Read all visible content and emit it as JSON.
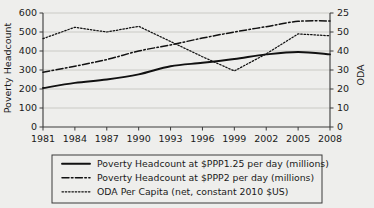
{
  "chart_data": {
    "type": "line",
    "title": "",
    "xlabel": "",
    "ylabel": "Poverty Headcount",
    "y2label": "ODA",
    "grid": true,
    "legend_position": "bottom",
    "x": [
      1981,
      1984,
      1987,
      1990,
      1993,
      1996,
      1999,
      2002,
      2005,
      2008
    ],
    "xtick_labels": [
      "1981",
      "1984",
      "1987",
      "1990",
      "1993",
      "1996",
      "1999",
      "2002",
      "2005",
      "2008"
    ],
    "xlim": [
      1981,
      2008
    ],
    "ylim": [
      0,
      600
    ],
    "ytick_labels": [
      "0",
      "100",
      "200",
      "300",
      "400",
      "500",
      "600"
    ],
    "ytick_values": [
      0,
      100,
      200,
      300,
      400,
      500,
      600
    ],
    "y2lim": [
      0,
      60
    ],
    "y2tick_labels": [
      "0",
      "10",
      "20",
      "30",
      "40",
      "50",
      "25"
    ],
    "y2tick_values": [
      0,
      10,
      20,
      30,
      40,
      50,
      60
    ],
    "series": [
      {
        "name": "Poverty Headcount at $PPP1.25 per day (millions)",
        "axis": "left",
        "style": "solid",
        "color": "#111111",
        "values": [
          205,
          232,
          250,
          277,
          320,
          338,
          358,
          382,
          395,
          382
        ]
      },
      {
        "name": "Poverty Headcount at $PPP2 per day (millions)",
        "axis": "left",
        "style": "dash-dot",
        "color": "#111111",
        "values": [
          288,
          320,
          355,
          400,
          432,
          468,
          500,
          528,
          556,
          558
        ]
      },
      {
        "name": "ODA Per Capita (net, constant 2010 $US)",
        "axis": "right",
        "style": "dotted",
        "color": "#111111",
        "values": [
          46.5,
          52.5,
          50.0,
          53.0,
          45.0,
          37.0,
          29.5,
          38.5,
          49.0,
          48.0
        ]
      }
    ]
  },
  "axes": {
    "left_title": "Poverty Headcount",
    "right_title": "ODA"
  },
  "legend": {
    "items": [
      {
        "label": "Poverty Headcount at $PPP1.25 per day (millions)",
        "style": "solid"
      },
      {
        "label": "Poverty Headcount at $PPP2 per day (millions)",
        "style": "dash-dot"
      },
      {
        "label": "ODA Per Capita (net, constant 2010 $US)",
        "style": "dotted"
      }
    ]
  }
}
